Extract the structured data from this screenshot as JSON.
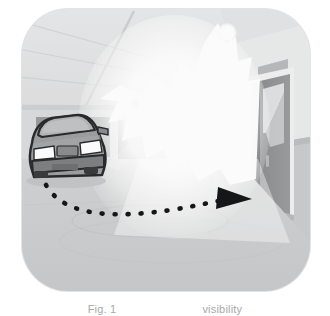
{
  "figure": {
    "kind": "photographic-illustration",
    "caption_left_fragment": "Fig. 1",
    "caption_gap": " ",
    "caption_right_fragment": "visibility",
    "caption_note": "caption text is cropped by the bottom edge of the screenshot and is not legible"
  },
  "panel": {
    "corner_radius_px": 46,
    "frame_color": "#e2e3e4",
    "background_color": "#d9dadb"
  },
  "scene": {
    "setting_label": "indoor parking garage",
    "ceiling": {
      "label": "garage ceiling with perspective beams",
      "color": "#e6e7e8",
      "beam_color": "#d6d7d8"
    },
    "back_wall": {
      "label": "upper back wall",
      "color": "#dcdddd"
    },
    "wall_panels": {
      "label": "dark wall panels behind car",
      "color": "#9a9c9d",
      "count": 2
    },
    "floor": {
      "label": "concrete garage floor",
      "color": "#cfd0d1",
      "marking_color": "#c5c6c7",
      "marking_shape": "ellipse"
    },
    "right_wall": {
      "label": "right side wall",
      "color": "#e9eaea",
      "wainscot_color": "#c9cacb"
    }
  },
  "elements": {
    "glare": {
      "label": "bright light glare burst",
      "color": "#ffffff",
      "description": "overexposed white starburst filling the center of the frame"
    },
    "lamp": {
      "label": "ceiling lamp fixture",
      "color": "#ffffff",
      "shape": "circle"
    },
    "secondary_light_dot": {
      "label": "secondary light reflection dot",
      "color": "#fcfcfc",
      "shape": "circle"
    },
    "car": {
      "label": "grey sedan, front three-quarter view",
      "body_color": "#9d9fa0",
      "roof_color": "#b4b6b7",
      "windshield_color": "#b9bbbc",
      "outline_color": "#2a2b2c",
      "headlight_color": "#ffffff",
      "bumper_color": "#7f8182",
      "headlight_count": 2
    },
    "path_arrow": {
      "label": "dashed travel path with arrowhead",
      "color": "#161718",
      "style": "dashed",
      "dash_count": 14,
      "arrow_direction": "right",
      "description": "curved dashed line from the car sweeping right toward the exit"
    },
    "doorway": {
      "label": "dark open doorway on right wall",
      "frame_color": "#f1f1f1",
      "jamb_color": "#55565a",
      "opening_color": "#8a8c8d",
      "highlight_color": "#e4e5e6"
    },
    "door_sign": {
      "label": "sign plaque above doorway",
      "color": "#b9babb"
    },
    "drain_pipe": {
      "label": "vertical pipe on wall",
      "color": "#f3f3f3",
      "bracket_color": "#b7b8b9",
      "edge_color": "#d0d1d2"
    }
  }
}
